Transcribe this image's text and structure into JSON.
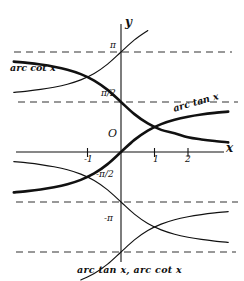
{
  "figure": {
    "caption": "arc tan x, arc cot x",
    "axis_x_label": "x",
    "axis_y_label": "y",
    "origin_label": "O",
    "curve_labels": {
      "arctan": "arc tan x",
      "arccot": "arc cot x"
    },
    "y_gridline_labels": {
      "pi": "π",
      "half_pi": "π/2",
      "neg_half_pi": "-π/2",
      "neg_pi": "-π"
    },
    "x_tick_labels": [
      "-1",
      "1",
      "2"
    ],
    "colors": {
      "ink": "#111111",
      "paper": "#ffffff",
      "asymptote": "#333333"
    }
  },
  "chart_data": {
    "type": "line",
    "title": "arc tan x, arc cot x",
    "xlabel": "x",
    "ylabel": "y",
    "xlim": [
      -3.2,
      3.7
    ],
    "ylim": [
      -3.9,
      2.6
    ],
    "grid": false,
    "legend": "inline-curve-labels",
    "x_ticks": [
      -1,
      1,
      2
    ],
    "y_ticks": [
      3.14159,
      1.5708,
      -1.5708,
      -3.14159
    ],
    "y_tick_labels": [
      "π",
      "π/2",
      "-π/2",
      "-π"
    ],
    "asymptotes": [
      {
        "y": 3.14159,
        "label": "π",
        "style": "dashed"
      },
      {
        "y": 1.5708,
        "label": "π/2",
        "style": "dashed"
      },
      {
        "y": -1.5708,
        "label": "-π/2",
        "style": "dashed"
      },
      {
        "y": -3.14159,
        "label": "-π",
        "style": "dashed"
      }
    ],
    "series": [
      {
        "name": "arc tan x",
        "formula": "atan(x)",
        "branch": "principal",
        "weight": "bold",
        "label": "arc tan x",
        "x": [
          -3.2,
          -2.8,
          -2.4,
          -2.0,
          -1.6,
          -1.2,
          -0.8,
          -0.4,
          0,
          0.4,
          0.8,
          1.2,
          1.6,
          2.0,
          2.4,
          2.8,
          3.2,
          3.7
        ],
        "y": [
          -1.268,
          -1.228,
          -1.176,
          -1.107,
          -1.012,
          -0.876,
          -0.675,
          -0.381,
          0,
          0.381,
          0.675,
          0.876,
          1.012,
          1.107,
          1.176,
          1.228,
          1.268,
          1.307
        ]
      },
      {
        "name": "arc cot x",
        "formula": "acot(x)",
        "branch": "principal",
        "weight": "bold",
        "label": "arc cot x",
        "x": [
          -3.2,
          -2.8,
          -2.4,
          -2.0,
          -1.6,
          -1.2,
          -0.8,
          -0.4,
          0,
          0.4,
          0.8,
          1.2,
          1.6,
          2.0,
          2.4,
          2.8,
          3.2,
          3.7
        ],
        "y": [
          2.839,
          2.799,
          2.747,
          2.678,
          2.583,
          2.447,
          2.246,
          1.952,
          1.571,
          1.19,
          0.896,
          0.695,
          0.589,
          0.464,
          0.395,
          0.343,
          0.303,
          0.264
        ]
      },
      {
        "name": "arc tan x + π",
        "formula": "atan(x)+pi",
        "branch": "secondary",
        "weight": "thin",
        "x": [
          -3.2,
          -2.8,
          -2.4,
          -2.0,
          -1.6,
          -1.2,
          -0.8,
          -0.4,
          0,
          0.4,
          0.8
        ],
        "y": [
          1.874,
          1.914,
          1.966,
          2.035,
          2.13,
          2.266,
          2.467,
          2.761,
          3.142,
          3.523,
          3.817
        ]
      },
      {
        "name": "arc cot x - π",
        "formula": "acot(x)-pi",
        "branch": "secondary",
        "weight": "thin",
        "x": [
          -3.2,
          -2.8,
          -2.4,
          -2.0,
          -1.6,
          -1.2,
          -0.8,
          -0.4,
          0,
          0.4,
          0.8,
          1.2,
          1.6,
          2.0,
          2.4,
          2.8,
          3.2,
          3.7
        ],
        "y": [
          -0.303,
          -0.343,
          -0.395,
          -0.464,
          -0.559,
          -0.695,
          -0.896,
          -1.19,
          -1.571,
          -1.952,
          -2.246,
          -2.447,
          -2.583,
          -2.678,
          -2.747,
          -2.799,
          -2.839,
          -2.878
        ]
      },
      {
        "name": "arc tan x - π",
        "formula": "atan(x)-pi",
        "branch": "secondary",
        "weight": "thin",
        "x": [
          -1.2,
          -0.8,
          -0.4,
          0,
          0.4,
          0.8,
          1.2,
          1.6,
          2.0,
          2.4,
          2.8,
          3.2,
          3.7
        ],
        "y": [
          -4.018,
          -3.817,
          -3.523,
          -3.142,
          -2.761,
          -2.467,
          -2.266,
          -2.13,
          -2.035,
          -1.966,
          -1.914,
          -1.874,
          -1.835
        ]
      }
    ]
  }
}
